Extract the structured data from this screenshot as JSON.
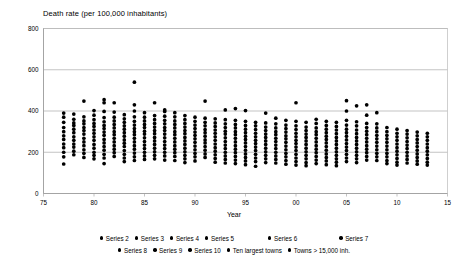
{
  "chart_data": {
    "type": "scatter",
    "title": "Death rate (per 100,000 inhabitants)",
    "xlabel": "Year",
    "ylabel": "",
    "xlim": [
      75,
      115
    ],
    "ylim": [
      0,
      800
    ],
    "xticks": [
      "75",
      "80",
      "85",
      "90",
      "95",
      "00",
      "05",
      "10",
      "15"
    ],
    "xtick_values": [
      75,
      80,
      85,
      90,
      95,
      100,
      105,
      110,
      115
    ],
    "yticks": [
      "0",
      "200",
      "400",
      "600",
      "800"
    ],
    "ytick_values": [
      0,
      200,
      400,
      600,
      800
    ],
    "grid": true,
    "grid_axis": "y",
    "legend_position": "bottom",
    "marker": "filled-circle",
    "marker_color": "#000000",
    "legend": [
      "Series 2",
      "Series 3",
      "Series 4",
      "Series 5",
      "Series 6",
      "Series 7",
      "Series 8",
      "Series 9",
      "Series 10",
      "Ten largest towns",
      "Towns > 15,000 inh."
    ],
    "legend_rows": [
      [
        "Series 2",
        "Series 3",
        "Series 4",
        "Series 5",
        "Series 6",
        "Series 7"
      ],
      [
        "Series 8",
        "Series 9",
        "Series 10",
        "Ten largest towns",
        "Towns > 15,000 inh."
      ]
    ],
    "points": [
      {
        "x": 77,
        "y": [
          390,
          370,
          345,
          320,
          300,
          280,
          262,
          240,
          222,
          200,
          178,
          143
        ]
      },
      {
        "x": 78,
        "y": [
          385,
          360,
          342,
          330,
          312,
          295,
          275,
          258,
          240,
          225,
          205,
          188
        ]
      },
      {
        "x": 79,
        "y": [
          448,
          372,
          352,
          338,
          320,
          305,
          288,
          268,
          250,
          232,
          212,
          195,
          175
        ]
      },
      {
        "x": 80,
        "y": [
          402,
          380,
          358,
          340,
          325,
          308,
          292,
          275,
          258,
          238,
          220,
          200,
          185,
          168
        ]
      },
      {
        "x": 81,
        "y": [
          455,
          440,
          398,
          368,
          348,
          330,
          315,
          298,
          282,
          262,
          245,
          228,
          210,
          190,
          172,
          145
        ]
      },
      {
        "x": 82,
        "y": [
          440,
          395,
          370,
          352,
          335,
          318,
          300,
          285,
          268,
          250,
          232,
          215,
          198,
          180
        ]
      },
      {
        "x": 83,
        "y": [
          382,
          362,
          345,
          328,
          312,
          295,
          278,
          260,
          244,
          228,
          208,
          190,
          172,
          155
        ]
      },
      {
        "x": 84,
        "y": [
          540,
          430,
          400,
          372,
          350,
          332,
          315,
          300,
          285,
          268,
          250,
          232,
          215,
          196,
          178,
          160
        ]
      },
      {
        "x": 85,
        "y": [
          392,
          370,
          352,
          335,
          320,
          302,
          288,
          270,
          252,
          235,
          218,
          200,
          182,
          165
        ]
      },
      {
        "x": 86,
        "y": [
          440,
          378,
          358,
          340,
          322,
          305,
          290,
          272,
          255,
          238,
          220,
          202,
          185,
          168
        ]
      },
      {
        "x": 87,
        "y": [
          405,
          398,
          375,
          355,
          338,
          320,
          305,
          288,
          270,
          252,
          235,
          218,
          200,
          182,
          162
        ]
      },
      {
        "x": 88,
        "y": [
          392,
          372,
          352,
          335,
          318,
          300,
          285,
          268,
          250,
          232,
          215,
          198,
          180,
          160
        ]
      },
      {
        "x": 89,
        "y": [
          378,
          358,
          340,
          322,
          305,
          290,
          272,
          255,
          238,
          220,
          202,
          185,
          168,
          150
        ]
      },
      {
        "x": 90,
        "y": [
          370,
          350,
          332,
          315,
          298,
          282,
          265,
          248,
          230,
          212,
          195,
          178,
          158
        ]
      },
      {
        "x": 91,
        "y": [
          448,
          365,
          345,
          328,
          310,
          295,
          278,
          260,
          245,
          228,
          210,
          192,
          175
        ]
      },
      {
        "x": 92,
        "y": [
          362,
          342,
          325,
          308,
          292,
          275,
          258,
          240,
          222,
          205,
          188,
          170,
          152
        ]
      },
      {
        "x": 93,
        "y": [
          405,
          358,
          338,
          320,
          302,
          288,
          270,
          252,
          235,
          218,
          200,
          182,
          165,
          148
        ]
      },
      {
        "x": 94,
        "y": [
          412,
          355,
          335,
          318,
          300,
          285,
          268,
          250,
          232,
          215,
          198,
          180,
          162,
          145
        ]
      },
      {
        "x": 95,
        "y": [
          402,
          350,
          330,
          312,
          295,
          278,
          262,
          245,
          228,
          210,
          192,
          175,
          158,
          140
        ]
      },
      {
        "x": 96,
        "y": [
          345,
          328,
          310,
          292,
          275,
          258,
          242,
          225,
          208,
          190,
          172,
          155,
          132
        ]
      },
      {
        "x": 97,
        "y": [
          390,
          342,
          322,
          305,
          288,
          272,
          255,
          238,
          220,
          202,
          185,
          168,
          150
        ]
      },
      {
        "x": 98,
        "y": [
          365,
          338,
          318,
          300,
          285,
          268,
          252,
          235,
          218,
          200,
          182,
          165,
          148
        ]
      },
      {
        "x": 99,
        "y": [
          355,
          332,
          315,
          298,
          280,
          265,
          248,
          230,
          212,
          195,
          178,
          160,
          142
        ]
      },
      {
        "x": 100,
        "y": [
          440,
          350,
          328,
          310,
          292,
          275,
          258,
          242,
          225,
          208,
          190,
          172,
          155,
          138
        ]
      },
      {
        "x": 101,
        "y": [
          345,
          322,
          305,
          288,
          272,
          255,
          238,
          220,
          202,
          185,
          168,
          150,
          135
        ]
      },
      {
        "x": 102,
        "y": [
          360,
          340,
          318,
          300,
          285,
          268,
          250,
          232,
          215,
          198,
          180,
          162,
          145
        ]
      },
      {
        "x": 103,
        "y": [
          350,
          330,
          312,
          295,
          278,
          262,
          245,
          228,
          210,
          192,
          175,
          158,
          140
        ]
      },
      {
        "x": 104,
        "y": [
          345,
          325,
          308,
          290,
          272,
          255,
          238,
          220,
          202,
          185,
          168,
          152,
          135
        ]
      },
      {
        "x": 105,
        "y": [
          450,
          400,
          355,
          332,
          312,
          295,
          278,
          260,
          242,
          225,
          208,
          190,
          172,
          155
        ]
      },
      {
        "x": 106,
        "y": [
          425,
          348,
          328,
          308,
          290,
          272,
          255,
          238,
          220,
          202,
          185,
          168,
          150
        ]
      },
      {
        "x": 107,
        "y": [
          430,
          380,
          340,
          320,
          302,
          285,
          268,
          250,
          232,
          215,
          198,
          180,
          162
        ]
      },
      {
        "x": 108,
        "y": [
          392,
          338,
          318,
          300,
          282,
          265,
          248,
          230,
          212,
          195,
          178,
          160
        ]
      },
      {
        "x": 109,
        "y": [
          320,
          300,
          282,
          265,
          248,
          230,
          212,
          195,
          178,
          160,
          145
        ]
      },
      {
        "x": 110,
        "y": [
          312,
          292,
          275,
          258,
          240,
          222,
          205,
          188,
          170,
          152,
          138
        ]
      },
      {
        "x": 111,
        "y": [
          305,
          288,
          270,
          252,
          235,
          218,
          200,
          182,
          165,
          148
        ]
      },
      {
        "x": 112,
        "y": [
          298,
          280,
          262,
          245,
          228,
          210,
          192,
          175,
          158,
          142
        ]
      },
      {
        "x": 113,
        "y": [
          292,
          275,
          258,
          240,
          222,
          205,
          188,
          170,
          152,
          138
        ]
      }
    ]
  }
}
